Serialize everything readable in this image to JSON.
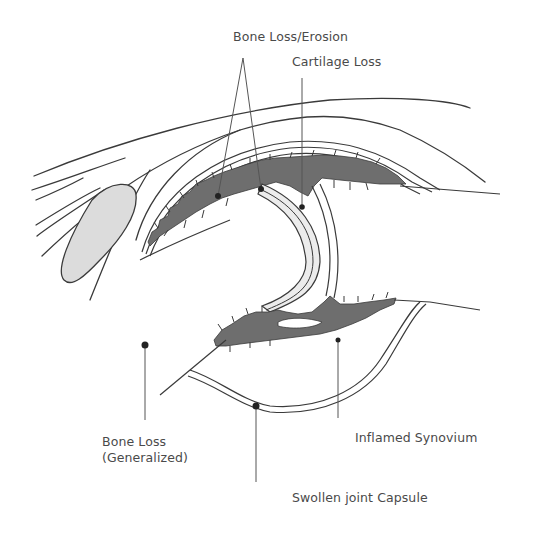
{
  "diagram": {
    "type": "anatomical-illustration",
    "colors": {
      "synovium": "#6e6e6e",
      "cartilage": "#ececec",
      "fat_pad": "#dcdcdc",
      "line": "#3a3a3a",
      "background": "#ffffff"
    },
    "labels": {
      "bone_erosion": "Bone  Loss/Erosion",
      "cartilage_loss": "Cartilage  Loss",
      "bone_loss_generalized_line1": "Bone  Loss",
      "bone_loss_generalized_line2": "(Generalized)",
      "inflamed_synovium": "Inflamed Synovium",
      "swollen_capsule": "Swollen joint Capsule"
    }
  }
}
